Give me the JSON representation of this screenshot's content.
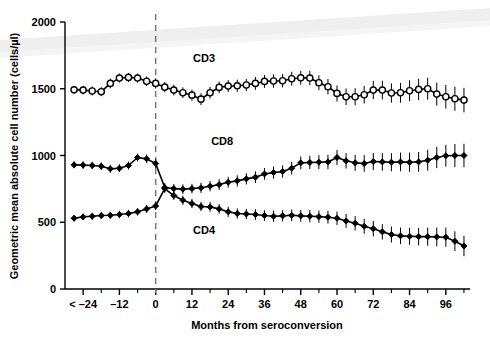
{
  "chart_data": {
    "type": "line",
    "title": "",
    "xlabel": "Months from seroconversion",
    "ylabel": "Geometric mean absolute cell number (cells/µl)",
    "xlim": [
      -30,
      104
    ],
    "ylim": [
      0,
      2000
    ],
    "grid": false,
    "legend_position": "inline-annotation",
    "y_ticks": [
      0,
      500,
      1000,
      1500,
      2000
    ],
    "y_tick_labels": [
      "0",
      "500",
      "1000",
      "1500",
      "2000"
    ],
    "x_ticks": [
      -24,
      -12,
      0,
      12,
      24,
      36,
      48,
      60,
      72,
      84,
      96
    ],
    "x_tick_labels": [
      "< –24",
      "–12",
      "0",
      "12",
      "24",
      "36",
      "48",
      "60",
      "72",
      "84",
      "96"
    ],
    "x_minor_ticks": [
      -18,
      -6,
      6,
      18,
      30,
      42,
      54,
      66,
      78,
      90,
      102
    ],
    "annotations": [
      {
        "text": "CD3",
        "x": 16,
        "y": 1700
      },
      {
        "text": "CD8",
        "x": 22,
        "y": 1075
      },
      {
        "text": "CD4",
        "x": 16,
        "y": 415
      }
    ],
    "reference_lines": [
      {
        "orientation": "vertical",
        "x": 0,
        "style": "dashed",
        "color": "#777777",
        "label": "seroconversion"
      }
    ],
    "series": [
      {
        "name": "CD3",
        "marker": "open-circle",
        "color": "#000000",
        "x": [
          -27,
          -24,
          -21,
          -18,
          -15,
          -12,
          -9,
          -6,
          -3,
          0,
          3,
          6,
          9,
          12,
          15,
          18,
          21,
          24,
          27,
          30,
          33,
          36,
          39,
          42,
          45,
          48,
          51,
          54,
          57,
          60,
          63,
          66,
          69,
          72,
          75,
          78,
          81,
          84,
          87,
          90,
          93,
          96,
          99,
          102
        ],
        "values": [
          1492,
          1490,
          1483,
          1478,
          1540,
          1580,
          1585,
          1580,
          1556,
          1540,
          1512,
          1490,
          1470,
          1452,
          1422,
          1470,
          1510,
          1520,
          1522,
          1528,
          1540,
          1555,
          1558,
          1560,
          1575,
          1582,
          1580,
          1545,
          1515,
          1465,
          1440,
          1440,
          1455,
          1490,
          1490,
          1468,
          1470,
          1485,
          1495,
          1500,
          1460,
          1440,
          1425,
          1415
        ],
        "err_low": [
          30,
          32,
          34,
          34,
          36,
          34,
          34,
          34,
          36,
          38,
          38,
          40,
          40,
          42,
          44,
          44,
          44,
          44,
          46,
          46,
          48,
          48,
          50,
          50,
          52,
          52,
          54,
          56,
          58,
          60,
          62,
          64,
          66,
          68,
          70,
          72,
          74,
          78,
          80,
          82,
          86,
          88,
          90,
          92
        ],
        "err_high": [
          30,
          32,
          34,
          34,
          36,
          34,
          34,
          34,
          36,
          38,
          38,
          40,
          40,
          42,
          44,
          44,
          44,
          44,
          46,
          46,
          48,
          48,
          50,
          50,
          52,
          52,
          54,
          56,
          58,
          60,
          62,
          64,
          66,
          68,
          70,
          72,
          74,
          78,
          80,
          82,
          86,
          88,
          90,
          92
        ]
      },
      {
        "name": "CD8",
        "marker": "filled-diamond",
        "color": "#000000",
        "x": [
          -27,
          -24,
          -21,
          -18,
          -15,
          -12,
          -9,
          -6,
          -3,
          0,
          3,
          6,
          9,
          12,
          15,
          18,
          21,
          24,
          27,
          30,
          33,
          36,
          39,
          42,
          45,
          48,
          51,
          54,
          57,
          60,
          63,
          66,
          69,
          72,
          75,
          78,
          81,
          84,
          87,
          90,
          93,
          96,
          99,
          102
        ],
        "values": [
          930,
          928,
          925,
          920,
          900,
          905,
          925,
          985,
          975,
          940,
          760,
          752,
          748,
          752,
          758,
          770,
          782,
          800,
          810,
          825,
          838,
          862,
          872,
          880,
          905,
          945,
          948,
          950,
          952,
          985,
          960,
          945,
          940,
          955,
          952,
          950,
          952,
          950,
          952,
          965,
          985,
          998,
          1000,
          1000
        ],
        "err_low": [
          26,
          28,
          28,
          28,
          30,
          30,
          30,
          30,
          32,
          34,
          34,
          34,
          36,
          36,
          38,
          38,
          40,
          40,
          42,
          42,
          44,
          44,
          46,
          46,
          48,
          48,
          50,
          52,
          54,
          56,
          58,
          60,
          62,
          64,
          66,
          68,
          70,
          72,
          74,
          78,
          80,
          82,
          86,
          88
        ],
        "err_high": [
          26,
          28,
          28,
          28,
          30,
          30,
          30,
          30,
          32,
          34,
          34,
          34,
          36,
          36,
          38,
          38,
          40,
          40,
          42,
          42,
          44,
          44,
          46,
          46,
          48,
          48,
          50,
          52,
          54,
          56,
          58,
          60,
          62,
          64,
          66,
          68,
          70,
          72,
          74,
          78,
          80,
          82,
          86,
          88
        ],
        "label_offset": [
          22,
          1075
        ]
      },
      {
        "name": "CD4",
        "marker": "filled-diamond",
        "color": "#000000",
        "x": [
          -27,
          -24,
          -21,
          -18,
          -15,
          -12,
          -9,
          -6,
          -3,
          0,
          3,
          6,
          9,
          12,
          15,
          18,
          21,
          24,
          27,
          30,
          33,
          36,
          39,
          42,
          45,
          48,
          51,
          54,
          57,
          60,
          63,
          66,
          69,
          72,
          75,
          78,
          81,
          84,
          87,
          90,
          93,
          96,
          99,
          102
        ],
        "values": [
          530,
          540,
          545,
          550,
          552,
          558,
          565,
          578,
          600,
          622,
          752,
          700,
          665,
          640,
          618,
          615,
          600,
          578,
          565,
          562,
          558,
          550,
          545,
          548,
          552,
          548,
          545,
          542,
          538,
          530,
          510,
          492,
          470,
          452,
          428,
          408,
          398,
          395,
          392,
          392,
          390,
          388,
          358,
          322
        ],
        "err_low": [
          24,
          24,
          26,
          26,
          26,
          28,
          28,
          28,
          30,
          30,
          32,
          32,
          34,
          34,
          34,
          36,
          36,
          38,
          38,
          38,
          40,
          40,
          42,
          42,
          44,
          44,
          46,
          46,
          48,
          50,
          52,
          54,
          56,
          58,
          58,
          60,
          62,
          64,
          66,
          68,
          70,
          72,
          74,
          76
        ],
        "err_high": [
          24,
          24,
          26,
          26,
          26,
          28,
          28,
          28,
          30,
          30,
          32,
          32,
          34,
          34,
          34,
          36,
          36,
          38,
          38,
          38,
          40,
          40,
          42,
          42,
          44,
          44,
          46,
          46,
          48,
          50,
          52,
          54,
          56,
          58,
          58,
          60,
          62,
          64,
          66,
          68,
          70,
          72,
          74,
          76
        ],
        "label_offset": [
          16,
          415
        ]
      }
    ]
  }
}
